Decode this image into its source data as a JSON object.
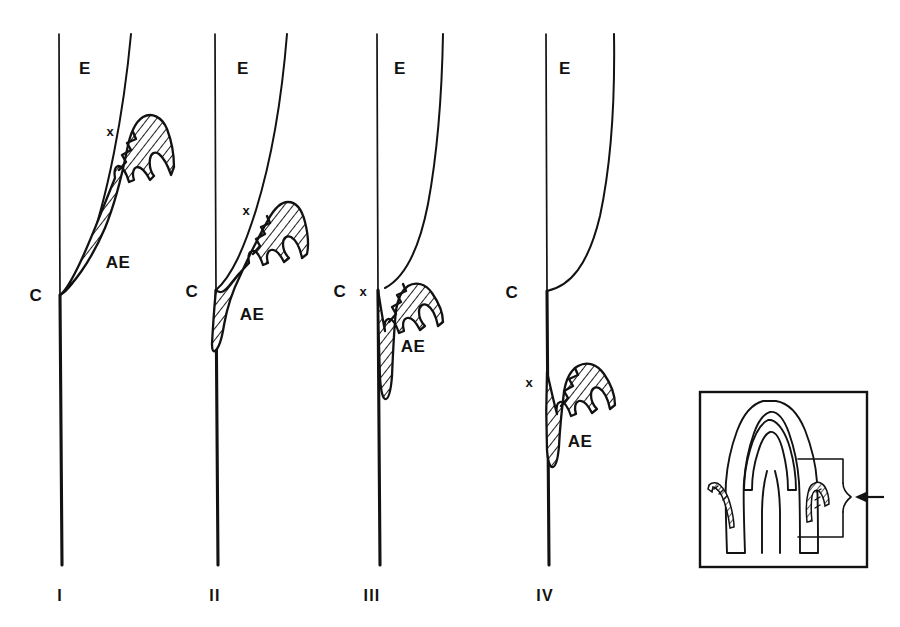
{
  "figure": {
    "background_color": "#ffffff",
    "ink_color": "#121212",
    "panel_count": 4
  },
  "legend": {
    "enamel_code": "E",
    "cej_code": "C",
    "attachment_epithelium_code": "AE",
    "marker_code": "x"
  },
  "panels": [
    {
      "roman": "I",
      "enamel_label": "E",
      "cej_label": "C",
      "ae_label": "AE",
      "marker": "x",
      "stage_description": "Attachment epithelium entirely on enamel, coronal to the cemento-enamel junction"
    },
    {
      "roman": "II",
      "enamel_label": "E",
      "cej_label": "C",
      "ae_label": "AE",
      "marker": "x",
      "stage_description": "Attachment epithelium spanning enamel and cementum across the cemento-enamel junction"
    },
    {
      "roman": "III",
      "enamel_label": "E",
      "cej_label": "C",
      "ae_label": "AE",
      "marker": "x",
      "stage_description": "Attachment epithelium at the cemento-enamel junction extending apically onto cementum"
    },
    {
      "roman": "IV",
      "enamel_label": "E",
      "cej_label": "C",
      "ae_label": "AE",
      "marker": "x",
      "stage_description": "Attachment epithelium entirely on cementum, apical to the cemento-enamel junction"
    }
  ],
  "inset": {
    "description": "Longitudinal section of a tooth showing the region of interest bracketed on the right side",
    "arrow": "left-pointing-arrow",
    "bracket": "region-bracket"
  }
}
